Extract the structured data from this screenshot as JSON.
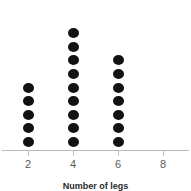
{
  "chart_data": {
    "type": "dotplot",
    "title": "",
    "xlabel": "Number of legs",
    "ylabel": "",
    "categories": [
      2,
      4,
      6,
      8
    ],
    "values": [
      5,
      9,
      7,
      0
    ],
    "tick_labels": [
      "2",
      "4",
      "6",
      "8"
    ],
    "xlim": [
      1,
      9
    ],
    "grid": false,
    "legend": null,
    "dot_color": "#121212",
    "axis_color": "#b9b9b9",
    "label_color": "#5b5b5b",
    "title_color": "#2b2b2b",
    "background": "#ffffff"
  },
  "axis": {
    "title": "Number of legs",
    "ticks": [
      {
        "label": "2",
        "value": 2,
        "count": 5
      },
      {
        "label": "4",
        "value": 4,
        "count": 9
      },
      {
        "label": "6",
        "value": 6,
        "count": 7
      },
      {
        "label": "8",
        "value": 8,
        "count": 0
      }
    ]
  }
}
